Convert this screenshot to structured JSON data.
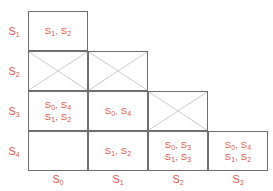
{
  "figure": {
    "name": "staircase-matrix",
    "text_color": "#e0564c",
    "border_color": "#6e6e6e",
    "cross_color": "#c9c9c9",
    "background": "#ffffff"
  },
  "row_labels": [
    "S1",
    "S2",
    "S3",
    "S4"
  ],
  "column_labels": [
    "S0",
    "S1",
    "S2",
    "S3"
  ],
  "grid": {
    "rows": [
      {
        "label": "S1",
        "cells": [
          {
            "col": "S0",
            "kind": "text",
            "lines": [
              "S1, S2"
            ]
          }
        ]
      },
      {
        "label": "S2",
        "cells": [
          {
            "col": "S0",
            "kind": "cross",
            "lines": []
          },
          {
            "col": "S1",
            "kind": "cross",
            "lines": []
          }
        ]
      },
      {
        "label": "S3",
        "cells": [
          {
            "col": "S0",
            "kind": "text",
            "lines": [
              "S0, S4",
              "S1, S2"
            ]
          },
          {
            "col": "S1",
            "kind": "text",
            "lines": [
              "S0, S4"
            ]
          },
          {
            "col": "S2",
            "kind": "cross",
            "lines": []
          }
        ]
      },
      {
        "label": "S4",
        "cells": [
          {
            "col": "S0",
            "kind": "empty",
            "lines": []
          },
          {
            "col": "S1",
            "kind": "text",
            "lines": [
              "S1, S2"
            ]
          },
          {
            "col": "S2",
            "kind": "text",
            "lines": [
              "S0, S3",
              "S1, S3"
            ]
          },
          {
            "col": "S3",
            "kind": "text",
            "lines": [
              "S0, S4",
              "S1, S2"
            ]
          }
        ]
      }
    ]
  }
}
